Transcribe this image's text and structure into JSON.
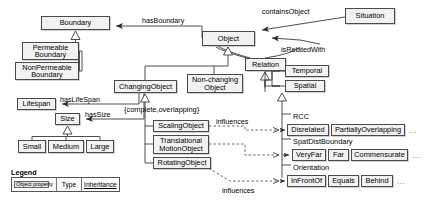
{
  "diagram": {
    "type": "uml-class-diagram",
    "nodes": [
      {
        "id": "boundary",
        "label": "Boundary",
        "x": 41,
        "y": 16,
        "w": 69,
        "h": 14
      },
      {
        "id": "permeable_boundary",
        "label": "Permeable Boundary",
        "x": 22,
        "y": 42,
        "w": 57,
        "h": 18,
        "two_line": true
      },
      {
        "id": "nonpermeable_boundary",
        "label": "NonPermeable Boundary",
        "x": 15,
        "y": 62,
        "w": 64,
        "h": 18,
        "two_line": true
      },
      {
        "id": "lifespan",
        "label": "Lifespan",
        "x": 17,
        "y": 98,
        "w": 39,
        "h": 12
      },
      {
        "id": "size",
        "label": "Size",
        "x": 55,
        "y": 113,
        "w": 25,
        "h": 12
      },
      {
        "id": "small",
        "label": "Small",
        "x": 18,
        "y": 140,
        "w": 28,
        "h": 13
      },
      {
        "id": "medium",
        "label": "Medium",
        "x": 48,
        "y": 140,
        "w": 36,
        "h": 13
      },
      {
        "id": "large",
        "label": "Large",
        "x": 86,
        "y": 140,
        "w": 28,
        "h": 13
      },
      {
        "id": "object",
        "label": "Object",
        "x": 202,
        "y": 31,
        "w": 53,
        "h": 15
      },
      {
        "id": "situation",
        "label": "Situation",
        "x": 345,
        "y": 8,
        "w": 50,
        "h": 16
      },
      {
        "id": "relation",
        "label": "Relation",
        "x": 245,
        "y": 58,
        "w": 41,
        "h": 13
      },
      {
        "id": "temporal",
        "label": "Temporal",
        "x": 285,
        "y": 65,
        "w": 44,
        "h": 12
      },
      {
        "id": "spatial",
        "label": "Spatial",
        "x": 285,
        "y": 80,
        "w": 40,
        "h": 12
      },
      {
        "id": "changing_object",
        "label": "ChangingObject",
        "x": 114,
        "y": 80,
        "w": 63,
        "h": 13
      },
      {
        "id": "non_changing_object",
        "label": "Non-changing Object",
        "x": 187,
        "y": 74,
        "w": 56,
        "h": 19,
        "two_line": true
      },
      {
        "id": "scaling_object",
        "label": "ScalingObject",
        "x": 153,
        "y": 120,
        "w": 56,
        "h": 12
      },
      {
        "id": "translational_motion_object",
        "label": "Translational MotionObject",
        "x": 153,
        "y": 135,
        "w": 56,
        "h": 19,
        "two_line": true
      },
      {
        "id": "rotating_object",
        "label": "RotatingObject",
        "x": 153,
        "y": 157,
        "w": 58,
        "h": 12
      },
      {
        "id": "disrelated",
        "label": "Disrelated",
        "x": 287,
        "y": 124,
        "w": 42,
        "h": 12
      },
      {
        "id": "partially_overlapping",
        "label": "PartiallyOverlapping",
        "x": 331,
        "y": 124,
        "w": 74,
        "h": 12
      },
      {
        "id": "veryfar",
        "label": "VeryFar",
        "x": 292,
        "y": 149,
        "w": 34,
        "h": 12
      },
      {
        "id": "far",
        "label": "Far",
        "x": 328,
        "y": 149,
        "w": 21,
        "h": 12
      },
      {
        "id": "commensurate",
        "label": "Commensurate",
        "x": 351,
        "y": 149,
        "w": 57,
        "h": 12
      },
      {
        "id": "infrontof",
        "label": "InFrontOf",
        "x": 287,
        "y": 175,
        "w": 39,
        "h": 12
      },
      {
        "id": "equals",
        "label": "Equals",
        "x": 328,
        "y": 175,
        "w": 31,
        "h": 12
      },
      {
        "id": "behind",
        "label": "Behind",
        "x": 361,
        "y": 175,
        "w": 32,
        "h": 12
      }
    ],
    "plain_labels": [
      {
        "id": "rcc",
        "text": "RCC",
        "x": 293,
        "y": 112
      },
      {
        "id": "spat_dist_boundary",
        "text": "SpatDistBoundary",
        "x": 293,
        "y": 137
      },
      {
        "id": "orientation",
        "text": "Orientation",
        "x": 293,
        "y": 163
      },
      {
        "id": "constraint_changing",
        "text": "{complete,overlapping}",
        "x": 124,
        "y": 105
      }
    ],
    "edge_labels": [
      {
        "id": "has_boundary",
        "text": "hasBoundary",
        "x": 142,
        "y": 16
      },
      {
        "id": "contains_object",
        "text": "containsObject",
        "x": 262,
        "y": 7
      },
      {
        "id": "is_related_with",
        "text": "isRelatedWith",
        "x": 281,
        "y": 45
      },
      {
        "id": "has_life_span",
        "text": "hasLifeSpan",
        "x": 60,
        "y": 95
      },
      {
        "id": "has_size",
        "text": "hasSize",
        "x": 85,
        "y": 110
      },
      {
        "id": "influences_upper",
        "text": "influences",
        "x": 216,
        "y": 117
      },
      {
        "id": "influences_lower",
        "text": "influences",
        "x": 222,
        "y": 186
      }
    ],
    "ellipses": [
      {
        "id": "rcc-more",
        "text": "...",
        "x": 409,
        "y": 126
      },
      {
        "id": "spatdist-more",
        "text": "...",
        "x": 412,
        "y": 151
      },
      {
        "id": "orientation-more",
        "text": "...",
        "x": 397,
        "y": 177
      }
    ],
    "legend": {
      "title": "Legend",
      "object_property": "Object property",
      "type": "Type",
      "inheritance": "Inheritance"
    },
    "colors": {
      "node_fill": "#f2f2f2",
      "node_stroke": "#4a4a4a",
      "line": "#3a3a3a",
      "dashed": "#555555",
      "background": "#ffffff"
    }
  }
}
